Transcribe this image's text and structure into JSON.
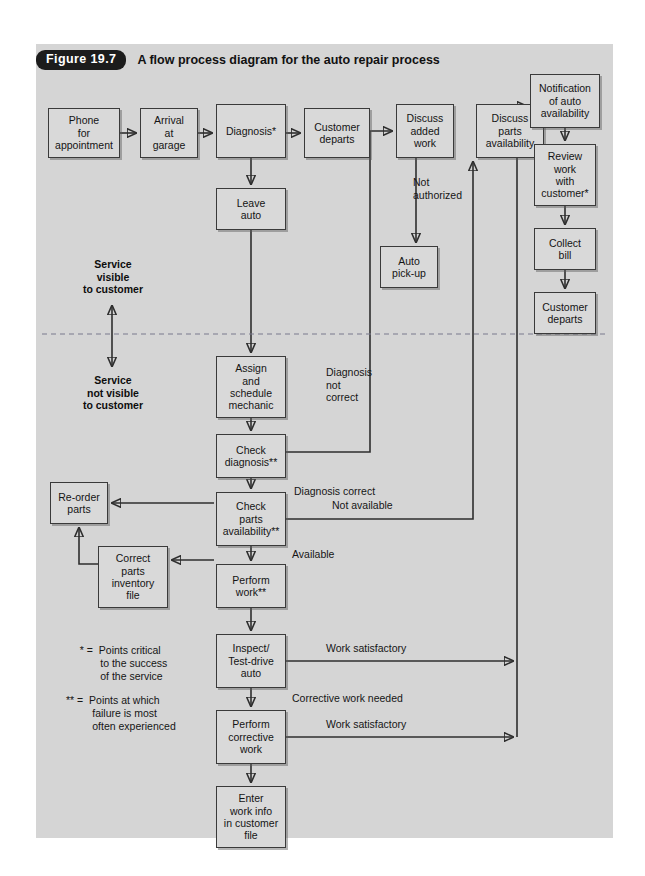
{
  "figure": {
    "badge": "Figure 19.7",
    "caption": "A flow process diagram for the auto repair process"
  },
  "zones": {
    "visible": "Service\nvisible\nto customer",
    "not_visible": "Service\nnot visible\nto customer",
    "divider_style": "dashed"
  },
  "nodes": [
    {
      "id": "phone",
      "label": "Phone\nfor\nappointment",
      "x": 12,
      "y": 64,
      "w": 72,
      "h": 50
    },
    {
      "id": "arrival",
      "label": "Arrival\nat\ngarage",
      "x": 104,
      "y": 64,
      "w": 58,
      "h": 50
    },
    {
      "id": "diagnosis",
      "label": "Diagnosis*",
      "x": 180,
      "y": 60,
      "w": 70,
      "h": 54
    },
    {
      "id": "customer-departs",
      "label": "Customer\ndeparts",
      "x": 268,
      "y": 64,
      "w": 66,
      "h": 50
    },
    {
      "id": "discuss-added",
      "label": "Discuss\nadded\nwork",
      "x": 360,
      "y": 60,
      "w": 58,
      "h": 54
    },
    {
      "id": "discuss-parts",
      "label": "Discuss\nparts\navailability",
      "x": 440,
      "y": 60,
      "w": 68,
      "h": 54
    },
    {
      "id": "notification",
      "label": "Notification\nof auto\navailability",
      "x": 494,
      "y": 30,
      "w": 70,
      "h": 54
    },
    {
      "id": "review-work",
      "label": "Review\nwork\nwith\ncustomer*",
      "x": 498,
      "y": 100,
      "w": 62,
      "h": 62
    },
    {
      "id": "collect-bill",
      "label": "Collect\nbill",
      "x": 498,
      "y": 184,
      "w": 62,
      "h": 42
    },
    {
      "id": "customer-departs2",
      "label": "Customer\ndeparts",
      "x": 498,
      "y": 248,
      "w": 62,
      "h": 42
    },
    {
      "id": "leave-auto",
      "label": "Leave\nauto",
      "x": 180,
      "y": 144,
      "w": 70,
      "h": 42
    },
    {
      "id": "auto-pickup",
      "label": "Auto\npick-up",
      "x": 344,
      "y": 202,
      "w": 58,
      "h": 42
    },
    {
      "id": "assign",
      "label": "Assign\nand\nschedule\nmechanic",
      "x": 180,
      "y": 312,
      "w": 70,
      "h": 62
    },
    {
      "id": "check-diagnosis",
      "label": "Check\ndiagnosis**",
      "x": 180,
      "y": 390,
      "w": 70,
      "h": 44
    },
    {
      "id": "reorder-parts",
      "label": "Re-order\nparts",
      "x": 14,
      "y": 438,
      "w": 58,
      "h": 42
    },
    {
      "id": "check-parts",
      "label": "Check\nparts\navailability**",
      "x": 180,
      "y": 448,
      "w": 70,
      "h": 54
    },
    {
      "id": "correct-parts",
      "label": "Correct\nparts\ninventory\nfile",
      "x": 62,
      "y": 502,
      "w": 70,
      "h": 62
    },
    {
      "id": "perform-work",
      "label": "Perform\nwork**",
      "x": 180,
      "y": 520,
      "w": 70,
      "h": 44
    },
    {
      "id": "inspect",
      "label": "Inspect/\nTest-drive\nauto",
      "x": 180,
      "y": 590,
      "w": 70,
      "h": 54
    },
    {
      "id": "perform-corr",
      "label": "Perform\ncorrective\nwork",
      "x": 180,
      "y": 666,
      "w": 70,
      "h": 54
    },
    {
      "id": "enter-work-info",
      "label": "Enter\nwork info\nin customer\nfile",
      "x": 180,
      "y": 742,
      "w": 70,
      "h": 62
    }
  ],
  "edge_labels": [
    {
      "id": "not-authorized",
      "text": "Not\nauthorized",
      "x": 377,
      "y": 132
    },
    {
      "id": "diagnosis-not-correct",
      "text": "Diagnosis\nnot\ncorrect",
      "x": 290,
      "y": 322
    },
    {
      "id": "diagnosis-correct",
      "text": "Diagnosis correct",
      "x": 258,
      "y": 441
    },
    {
      "id": "not-available",
      "text": "Not available",
      "x": 296,
      "y": 455
    },
    {
      "id": "available",
      "text": "Available",
      "x": 256,
      "y": 504
    },
    {
      "id": "work-satisfactory-1",
      "text": "Work satisfactory",
      "x": 290,
      "y": 598
    },
    {
      "id": "corrective-work-needed",
      "text": "Corrective work needed",
      "x": 256,
      "y": 648
    },
    {
      "id": "work-satisfactory-2",
      "text": "Work satisfactory",
      "x": 290,
      "y": 674
    }
  ],
  "footnotes": [
    {
      "id": "footnote-single-star",
      "text": "  * =  Points critical\n         to the success\n         of the service",
      "x": 38,
      "y": 600
    },
    {
      "id": "footnote-double-star",
      "text": "** =  Points at which\n         failure is most\n         often experienced",
      "x": 30,
      "y": 650
    }
  ],
  "colors": {
    "panel_background": "#d5d5d5",
    "node_fill": "#d9d9d9",
    "node_border": "#3a3a3a",
    "wire": "#2e2e2e",
    "divider": "#7a7a8e",
    "badge_background": "#1c1c1c",
    "badge_text": "#ffffff"
  }
}
